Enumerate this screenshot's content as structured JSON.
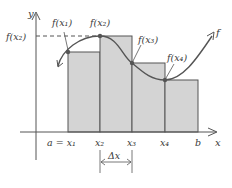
{
  "diagram": {
    "type": "riemann-sum-upper",
    "axes": {
      "x_label": "x",
      "y_label": "y"
    },
    "y_reference_label": "f(x₂)",
    "curve_label": "f",
    "point_labels": [
      "f(x₁)",
      "f(x₂)",
      "f(x₃)",
      "f(x₄)"
    ],
    "x_tick_labels": [
      "a = x₁",
      "x₂",
      "x₃",
      "x₄",
      "b"
    ],
    "interval_label": "Δx",
    "colors": {
      "rect_fill": "#d4d4d4",
      "stroke": "#555555",
      "curve": "#555555"
    }
  }
}
